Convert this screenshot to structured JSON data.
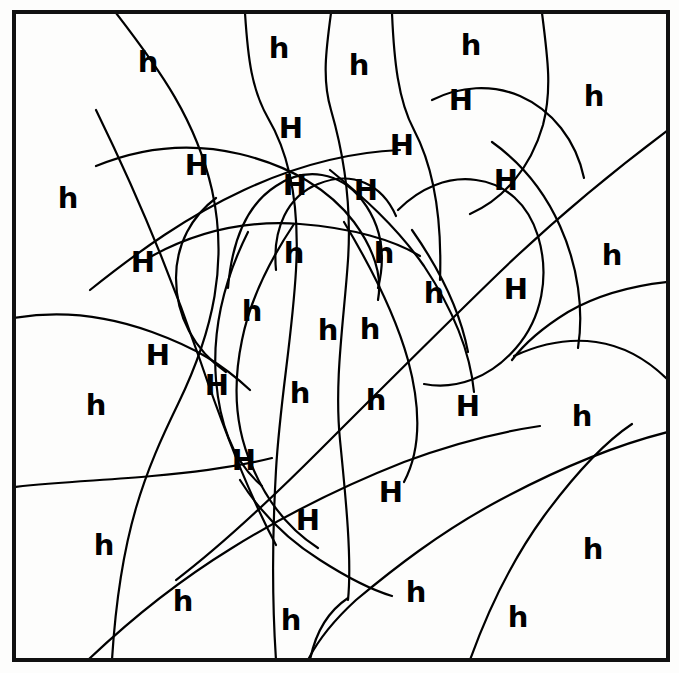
{
  "page": {
    "background_color": "#fdfdfc",
    "ink_color": "#000000"
  },
  "frame": {
    "name": "puzzle-border",
    "x": 14,
    "y": 12,
    "width": 654,
    "height": 648,
    "stroke_width": 4,
    "color": "#111111"
  },
  "letters": {
    "uppercase": "H",
    "lowercase": "h",
    "count_uppercase": 20,
    "count_lowercase": 28,
    "total_regions": 48
  },
  "regions": [
    {
      "id": 1,
      "letter": "h",
      "case": "lower",
      "x": 148,
      "y": 62
    },
    {
      "id": 2,
      "letter": "h",
      "case": "lower",
      "x": 279,
      "y": 48
    },
    {
      "id": 3,
      "letter": "h",
      "case": "lower",
      "x": 359,
      "y": 65
    },
    {
      "id": 4,
      "letter": "h",
      "case": "lower",
      "x": 471,
      "y": 45
    },
    {
      "id": 5,
      "letter": "H",
      "case": "upper",
      "x": 461,
      "y": 100
    },
    {
      "id": 6,
      "letter": "h",
      "case": "lower",
      "x": 594,
      "y": 96
    },
    {
      "id": 7,
      "letter": "H",
      "case": "upper",
      "x": 291,
      "y": 128
    },
    {
      "id": 8,
      "letter": "H",
      "case": "upper",
      "x": 402,
      "y": 145
    },
    {
      "id": 9,
      "letter": "H",
      "case": "upper",
      "x": 197,
      "y": 165
    },
    {
      "id": 10,
      "letter": "H",
      "case": "upper",
      "x": 506,
      "y": 180
    },
    {
      "id": 11,
      "letter": "h",
      "case": "lower",
      "x": 68,
      "y": 198
    },
    {
      "id": 12,
      "letter": "H",
      "case": "upper",
      "x": 295,
      "y": 185
    },
    {
      "id": 13,
      "letter": "H",
      "case": "upper",
      "x": 366,
      "y": 190
    },
    {
      "id": 14,
      "letter": "H",
      "case": "upper",
      "x": 143,
      "y": 262
    },
    {
      "id": 15,
      "letter": "h",
      "case": "lower",
      "x": 294,
      "y": 253
    },
    {
      "id": 16,
      "letter": "h",
      "case": "lower",
      "x": 384,
      "y": 253
    },
    {
      "id": 17,
      "letter": "h",
      "case": "lower",
      "x": 612,
      "y": 255
    },
    {
      "id": 18,
      "letter": "h",
      "case": "lower",
      "x": 434,
      "y": 293
    },
    {
      "id": 19,
      "letter": "H",
      "case": "upper",
      "x": 516,
      "y": 289
    },
    {
      "id": 20,
      "letter": "h",
      "case": "lower",
      "x": 252,
      "y": 311
    },
    {
      "id": 21,
      "letter": "h",
      "case": "lower",
      "x": 328,
      "y": 330
    },
    {
      "id": 22,
      "letter": "h",
      "case": "lower",
      "x": 370,
      "y": 329
    },
    {
      "id": 23,
      "letter": "H",
      "case": "upper",
      "x": 158,
      "y": 355
    },
    {
      "id": 24,
      "letter": "H",
      "case": "upper",
      "x": 217,
      "y": 385
    },
    {
      "id": 25,
      "letter": "h",
      "case": "lower",
      "x": 300,
      "y": 393
    },
    {
      "id": 26,
      "letter": "h",
      "case": "lower",
      "x": 376,
      "y": 400
    },
    {
      "id": 27,
      "letter": "H",
      "case": "upper",
      "x": 468,
      "y": 406
    },
    {
      "id": 28,
      "letter": "h",
      "case": "lower",
      "x": 96,
      "y": 405
    },
    {
      "id": 29,
      "letter": "h",
      "case": "lower",
      "x": 582,
      "y": 416
    },
    {
      "id": 30,
      "letter": "H",
      "case": "upper",
      "x": 244,
      "y": 460
    },
    {
      "id": 31,
      "letter": "H",
      "case": "upper",
      "x": 391,
      "y": 492
    },
    {
      "id": 32,
      "letter": "H",
      "case": "upper",
      "x": 308,
      "y": 520
    },
    {
      "id": 33,
      "letter": "h",
      "case": "lower",
      "x": 104,
      "y": 545
    },
    {
      "id": 34,
      "letter": "h",
      "case": "lower",
      "x": 593,
      "y": 549
    },
    {
      "id": 35,
      "letter": "h",
      "case": "lower",
      "x": 183,
      "y": 601
    },
    {
      "id": 36,
      "letter": "h",
      "case": "lower",
      "x": 291,
      "y": 620
    },
    {
      "id": 37,
      "letter": "h",
      "case": "lower",
      "x": 416,
      "y": 592
    },
    {
      "id": 38,
      "letter": "h",
      "case": "lower",
      "x": 518,
      "y": 617
    }
  ],
  "curves": [
    "M 116 13 C 160 70, 196 120, 212 190 C 228 262, 214 330, 178 404 C 146 470, 120 530, 112 660",
    "M 245 13 C 248 60, 252 90, 268 118 C 288 152, 300 200, 296 270 C 292 340, 280 400, 276 470 C 272 540, 272 600, 276 660",
    "M 331 13 C 326 50, 322 80, 331 110 C 342 148, 352 200, 348 260 C 344 320, 334 380, 340 440 C 346 500, 352 560, 348 600",
    "M 392 13 C 394 60, 398 100, 414 130 C 434 168, 442 220, 440 280",
    "M 542 13 C 548 60, 552 90, 543 125 C 530 170, 502 200, 470 214",
    "M 14 318 C 60 310, 108 316, 152 332 C 196 348, 222 364, 250 390",
    "M 14 487 C 60 482, 110 480, 152 476 C 200 472, 240 466, 272 458",
    "M 96 110 C 140 200, 176 290, 200 360 C 226 436, 252 500, 276 545",
    "M 668 130 C 620 166, 560 214, 500 272 C 440 330, 380 390, 320 450 C 268 502, 218 548, 176 580",
    "M 668 432 C 620 444, 560 468, 500 500 C 440 532, 392 570, 356 600 C 332 622, 316 644, 308 660",
    "M 88 660 C 130 620, 180 580, 232 548 C 290 512, 348 484, 404 462 C 452 444, 500 432, 540 426",
    "M 470 660 C 488 610, 512 560, 544 516 C 578 470, 608 440, 632 424",
    "M 90 290 C 140 250, 188 216, 244 190 C 300 164, 352 152, 400 150",
    "M 96 166 C 140 148, 190 142, 240 154 C 290 166, 330 190, 354 222 C 376 252, 382 278, 378 300",
    "M 228 288 C 232 240, 248 204, 276 186 C 306 166, 340 172, 362 200 C 382 226, 386 256, 378 288",
    "M 276 270 C 272 228, 288 196, 318 184 C 352 170, 382 184, 396 216",
    "M 152 256 C 196 232, 246 220, 300 224 C 352 228, 394 240, 420 256",
    "M 330 170 C 362 196, 396 226, 424 266 C 452 308, 470 350, 474 392",
    "M 248 232 C 224 280, 212 330, 216 380 C 220 428, 236 464, 262 486",
    "M 294 224 C 270 260, 250 300, 242 340 C 232 388, 236 430, 252 466 C 268 504, 290 530, 318 548",
    "M 344 222 C 368 262, 394 310, 408 360 C 422 412, 420 452, 404 482",
    "M 412 230 C 440 270, 460 310, 468 352",
    "M 398 210 C 420 188, 448 176, 476 180 C 506 184, 528 204, 538 236 C 550 276, 542 318, 516 348 C 490 378, 456 390, 424 384",
    "M 216 198 C 192 216, 176 244, 176 278 C 176 316, 194 350, 226 372",
    "M 492 142 C 520 162, 544 190, 560 226 C 578 266, 584 310, 578 348",
    "M 432 100 C 460 86, 492 84, 520 96 C 552 110, 576 140, 584 178",
    "M 668 282 C 630 286, 596 296, 568 312 C 542 328, 524 344, 512 360",
    "M 514 356 C 540 344, 568 338, 596 342 C 624 346, 648 360, 668 380",
    "M 348 598 C 330 610, 316 630, 310 660",
    "M 240 480 C 260 512, 288 540, 320 560 C 348 578, 372 590, 392 596"
  ]
}
